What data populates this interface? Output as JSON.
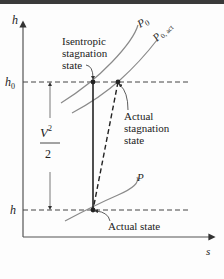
{
  "diagram": {
    "type": "h-s diagram",
    "axes": {
      "y_label": "h",
      "x_label": "s"
    },
    "levels": {
      "h0_label": "h",
      "h0_sub": "0",
      "h_label": "h"
    },
    "isobars": [
      {
        "label": "P",
        "sub": "0"
      },
      {
        "label": "P",
        "sub": "0, act"
      },
      {
        "label": "P",
        "sub": ""
      }
    ],
    "annotations": {
      "isentropic_line1": "Isentropic",
      "isentropic_line2": "stagnation",
      "isentropic_line3": "state",
      "actual_stag_line1": "Actual",
      "actual_stag_line2": "stagnation",
      "actual_stag_line3": "state",
      "actual_state": "Actual state",
      "kinetic_num": "V",
      "kinetic_exp": "2",
      "kinetic_den": "2"
    },
    "colors": {
      "axis": "#333333",
      "isobar": "#8a8a8a",
      "process_line": "#222222",
      "topbar": "#3a3a3a"
    }
  }
}
